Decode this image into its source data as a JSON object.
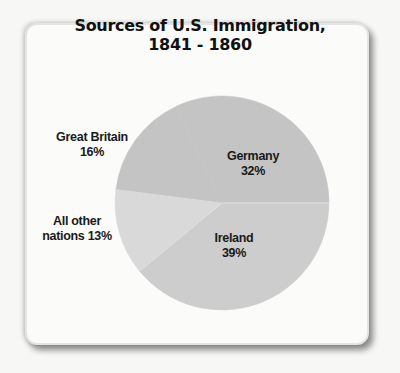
{
  "chart_data": {
    "type": "pie",
    "title": "Sources of U.S. Immigration, 1841 - 1860",
    "title_lines": [
      "Sources of U.S. Immigration,",
      "1841 - 1860"
    ],
    "categories": [
      "Germany",
      "Great Britain",
      "All other nations",
      "Ireland"
    ],
    "values": [
      32,
      16,
      13,
      39
    ],
    "unit": "%",
    "colors": [
      "#c4c4c4",
      "#c4c4c4",
      "#d9d9d9",
      "#cdcdcd"
    ],
    "labels": [
      {
        "name": "Germany",
        "value_text": "32%"
      },
      {
        "name": "Great Britain",
        "value_text": "16%"
      },
      {
        "name": "All other",
        "name2": "nations 13%"
      },
      {
        "name": "Ireland",
        "value_text": "39%"
      }
    ],
    "legend": "none (labels placed on/near slices)"
  }
}
